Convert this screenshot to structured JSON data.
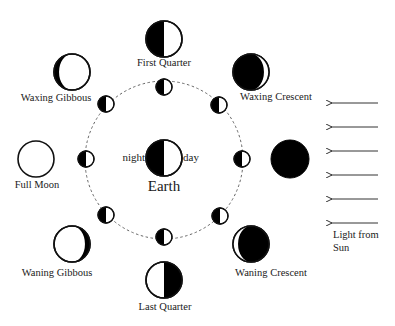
{
  "diagram": {
    "colors": {
      "dark": "#000000",
      "light": "#ffffff",
      "stroke": "#111111",
      "orbit": "#666666",
      "text": "#1a1a1a"
    },
    "orbit": {
      "cx": 164,
      "cy": 160,
      "r": 79
    },
    "earth": {
      "cx": 164,
      "cy": 158,
      "r": 18,
      "label": "Earth",
      "night_label": "night",
      "day_label": "day"
    },
    "orbit_moons": [
      {
        "name": "orbit-moon-top",
        "cx": 164,
        "cy": 87
      },
      {
        "name": "orbit-moon-upper-right",
        "cx": 219,
        "cy": 105
      },
      {
        "name": "orbit-moon-right",
        "cx": 242,
        "cy": 159
      },
      {
        "name": "orbit-moon-lower-right",
        "cx": 220,
        "cy": 216
      },
      {
        "name": "orbit-moon-bottom",
        "cx": 164,
        "cy": 237
      },
      {
        "name": "orbit-moon-lower-left",
        "cx": 106,
        "cy": 215
      },
      {
        "name": "orbit-moon-left",
        "cx": 86,
        "cy": 159
      },
      {
        "name": "orbit-moon-upper-left",
        "cx": 106,
        "cy": 104
      }
    ],
    "phases": [
      {
        "key": "first_quarter",
        "label": "First Quarter",
        "type": "first-quarter",
        "cx": 164,
        "cy": 39,
        "r": 18,
        "label_x": 164,
        "label_y": 66,
        "anchor": "middle"
      },
      {
        "key": "waxing_crescent",
        "label": "Waxing Crescent",
        "type": "waxing-crescent",
        "cx": 251,
        "cy": 72,
        "r": 18,
        "label_x": 276,
        "label_y": 100,
        "anchor": "middle"
      },
      {
        "key": "new_moon",
        "label": "",
        "type": "new",
        "cx": 290,
        "cy": 159,
        "r": 19,
        "label_x": 0,
        "label_y": 0,
        "anchor": "middle"
      },
      {
        "key": "waning_crescent",
        "label": "Waning Crescent",
        "type": "waning-crescent",
        "cx": 251,
        "cy": 244,
        "r": 18,
        "label_x": 271,
        "label_y": 276,
        "anchor": "middle"
      },
      {
        "key": "last_quarter",
        "label": "Last Quarter",
        "type": "last-quarter",
        "cx": 164,
        "cy": 280,
        "r": 18,
        "label_x": 165,
        "label_y": 310,
        "anchor": "middle"
      },
      {
        "key": "waning_gibbous",
        "label": "Waning Gibbous",
        "type": "waning-gibbous",
        "cx": 72,
        "cy": 244,
        "r": 18,
        "label_x": 57,
        "label_y": 276,
        "anchor": "middle"
      },
      {
        "key": "full_moon",
        "label": "Full Moon",
        "type": "full",
        "cx": 36,
        "cy": 159,
        "r": 18,
        "label_x": 37,
        "label_y": 188,
        "anchor": "middle"
      },
      {
        "key": "waxing_gibbous",
        "label": "Waxing Gibbous",
        "type": "waxing-gibbous",
        "cx": 72,
        "cy": 72,
        "r": 18,
        "label_x": 56,
        "label_y": 101,
        "anchor": "middle"
      }
    ],
    "sunlight": {
      "arrows_y": [
        103,
        127,
        151,
        175,
        199,
        223
      ],
      "x_start": 378,
      "x_end": 330,
      "label_line1": "Light from",
      "label_line2": "Sun",
      "label_x": 333,
      "label_y1": 238,
      "label_y2": 251
    }
  }
}
